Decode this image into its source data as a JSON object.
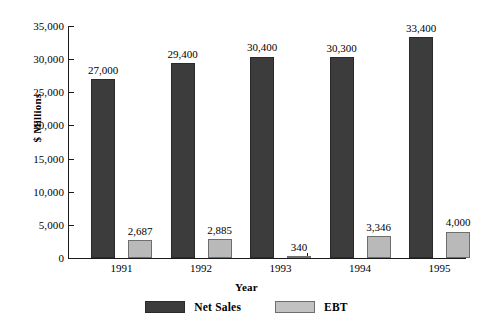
{
  "chart_data": {
    "type": "bar",
    "title": "",
    "xlabel": "Year",
    "ylabel": "$ Millions",
    "categories": [
      "1991",
      "1992",
      "1993",
      "1994",
      "1995"
    ],
    "series": [
      {
        "name": "Net Sales",
        "color": "#3c3c3c",
        "values": [
          27000,
          29400,
          30400,
          30300,
          33400
        ],
        "labels": [
          "27,000",
          "29,400",
          "30,400",
          "30,300",
          "33,400"
        ]
      },
      {
        "name": "EBT",
        "color": "#b9b9b9",
        "values": [
          2687,
          2885,
          340,
          3346,
          4000
        ],
        "labels": [
          "2,687",
          "2,885",
          "340",
          "3,346",
          "4,000"
        ]
      }
    ],
    "ylim": [
      0,
      35000
    ],
    "yticks": [
      0,
      5000,
      10000,
      15000,
      20000,
      25000,
      30000,
      35000
    ],
    "ytick_labels": [
      "0",
      "5,000",
      "10,000",
      "15,000",
      "20,000",
      "25,000",
      "30,000",
      "35,000"
    ],
    "grid": false,
    "legend_position": "bottom"
  },
  "legend": {
    "items": [
      {
        "label": "Net Sales"
      },
      {
        "label": "EBT"
      }
    ]
  },
  "axes": {
    "y_title": "$ Millions",
    "x_title": "Year"
  }
}
